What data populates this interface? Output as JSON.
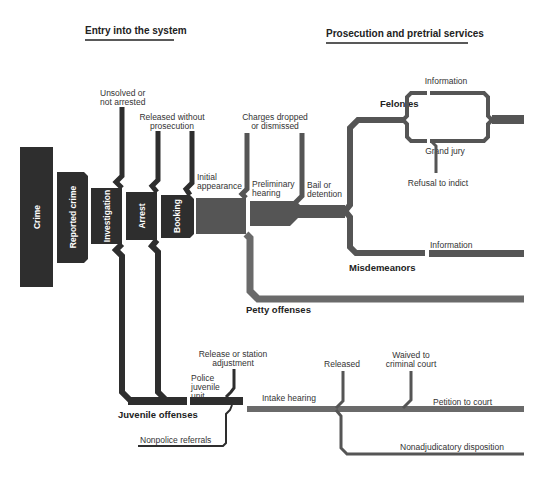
{
  "headers": {
    "entry": "Entry into the system",
    "prosecution": "Prosecution and pretrial services"
  },
  "stages": {
    "crime": "Crime",
    "reported_crime": "Reported crime",
    "investigation": "Investigation",
    "arrest": "Arrest",
    "booking": "Booking"
  },
  "labels": {
    "unsolved_1": "Unsolved or",
    "unsolved_2": "not arrested",
    "released_wo_1": "Released without",
    "released_wo_2": "prosecution",
    "initial_1": "Initial",
    "initial_2": "appearance",
    "charges_1": "Charges dropped",
    "charges_2": "or dismissed",
    "prelim_1": "Preliminary",
    "prelim_2": "hearing",
    "bail_1": "Bail or",
    "bail_2": "detention",
    "information_top": "Information",
    "grand_jury": "Grand jury",
    "refusal": "Refusal to indict",
    "information_misd": "Information",
    "release_station_1": "Release or station",
    "release_station_2": "adjustment",
    "police_juv_1": "Police",
    "police_juv_2": "juvenile",
    "police_juv_3": "unit",
    "intake": "Intake hearing",
    "released": "Released",
    "waived_1": "Waived to",
    "waived_2": "criminal court",
    "petition": "Petition to court",
    "nonpolice": "Nonpolice referrals",
    "nonadjudicatory": "Nonadjudicatory disposition"
  },
  "categories": {
    "felonies": "Felonies",
    "misdemeanors": "Misdemeanors",
    "petty": "Petty offenses",
    "juvenile": "Juvenile offenses"
  },
  "colors": {
    "dark": "#2e2e2e",
    "mid": "#555555",
    "light": "#6a6a6a"
  }
}
